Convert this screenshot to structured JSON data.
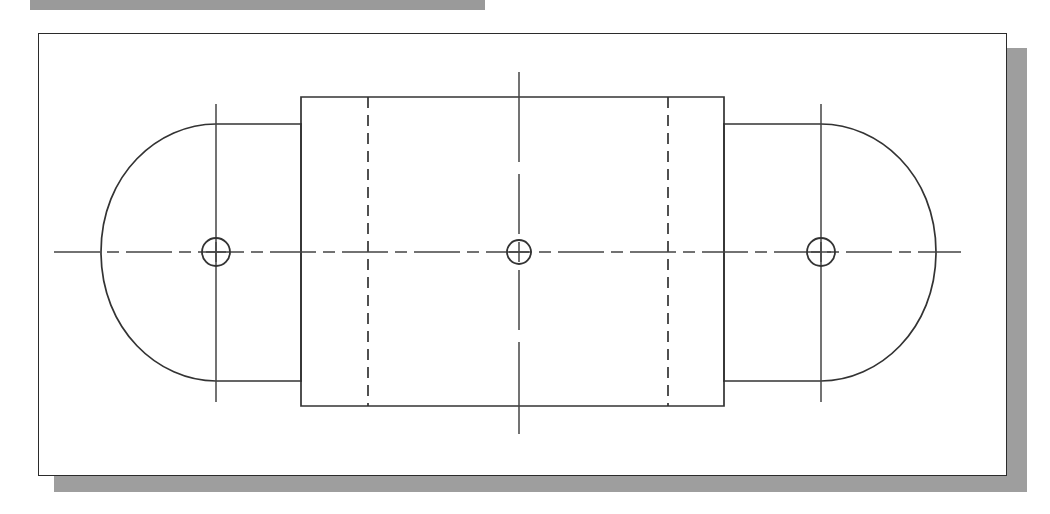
{
  "page": {
    "background_color": "#ffffff",
    "width": 1050,
    "height": 514
  },
  "top_banner": {
    "name": "top-banner-strip",
    "color": "#9a9a9a",
    "x": 30,
    "y": 0,
    "width": 455,
    "height": 10
  },
  "drawing_frame": {
    "name": "drawing-sheet-frame",
    "border_color": "#2b2b2b",
    "fill_color": "#ffffff",
    "shadow_color": "#9e9e9e",
    "x": 38,
    "y": 33,
    "width": 969,
    "height": 443,
    "shadow_offset_x": 16,
    "shadow_offset_y": 15
  },
  "drawing": {
    "description": "Symmetric plate: two rounded-end lobes with bolt holes joined by a central rectangular boss",
    "line_color": "#333333",
    "centerline_color": "#444444",
    "object_line_width": 1.7,
    "hidden_dash_pattern": "11 7",
    "center_dashdot_pattern": "46 7 12 7",
    "geometry": {
      "part_center_y": 218,
      "left_lobe": {
        "name": "left-rounded-lobe",
        "arc_center_x": 177,
        "arc_radius_x": 115,
        "arc_radius_y": 128,
        "flat_right_edge_x": 262,
        "top_y": 90,
        "bottom_y": 347
      },
      "right_lobe": {
        "name": "right-rounded-lobe",
        "arc_center_x": 782,
        "arc_radius_x": 115,
        "arc_radius_y": 128,
        "flat_left_edge_x": 685,
        "top_y": 90,
        "bottom_y": 347
      },
      "center_boss": {
        "name": "center-rectangular-boss",
        "left_x": 262,
        "right_x": 685,
        "top_y": 63,
        "bottom_y": 372
      },
      "hidden_lines": {
        "name": "hidden-edge-lines",
        "x_positions": [
          329,
          629
        ],
        "top_y": 63,
        "bottom_y": 372
      },
      "holes": [
        {
          "name": "left-bolt-hole",
          "cx": 177,
          "cy": 218,
          "r": 14
        },
        {
          "name": "center-bolt-hole",
          "cx": 480,
          "cy": 218,
          "r": 12
        },
        {
          "name": "right-bolt-hole",
          "cx": 782,
          "cy": 218,
          "r": 14
        }
      ],
      "vertical_centerlines": [
        {
          "name": "left-vertical-centerline",
          "x": 177,
          "y1": 70,
          "y2": 368
        },
        {
          "name": "center-vertical-centerline",
          "x": 480,
          "y1": 38,
          "y2": 400
        },
        {
          "name": "right-vertical-centerline",
          "x": 782,
          "y1": 70,
          "y2": 368
        }
      ],
      "horizontal_centerline": {
        "name": "main-horizontal-centerline",
        "y": 218,
        "x1": 15,
        "x2": 922
      }
    }
  }
}
